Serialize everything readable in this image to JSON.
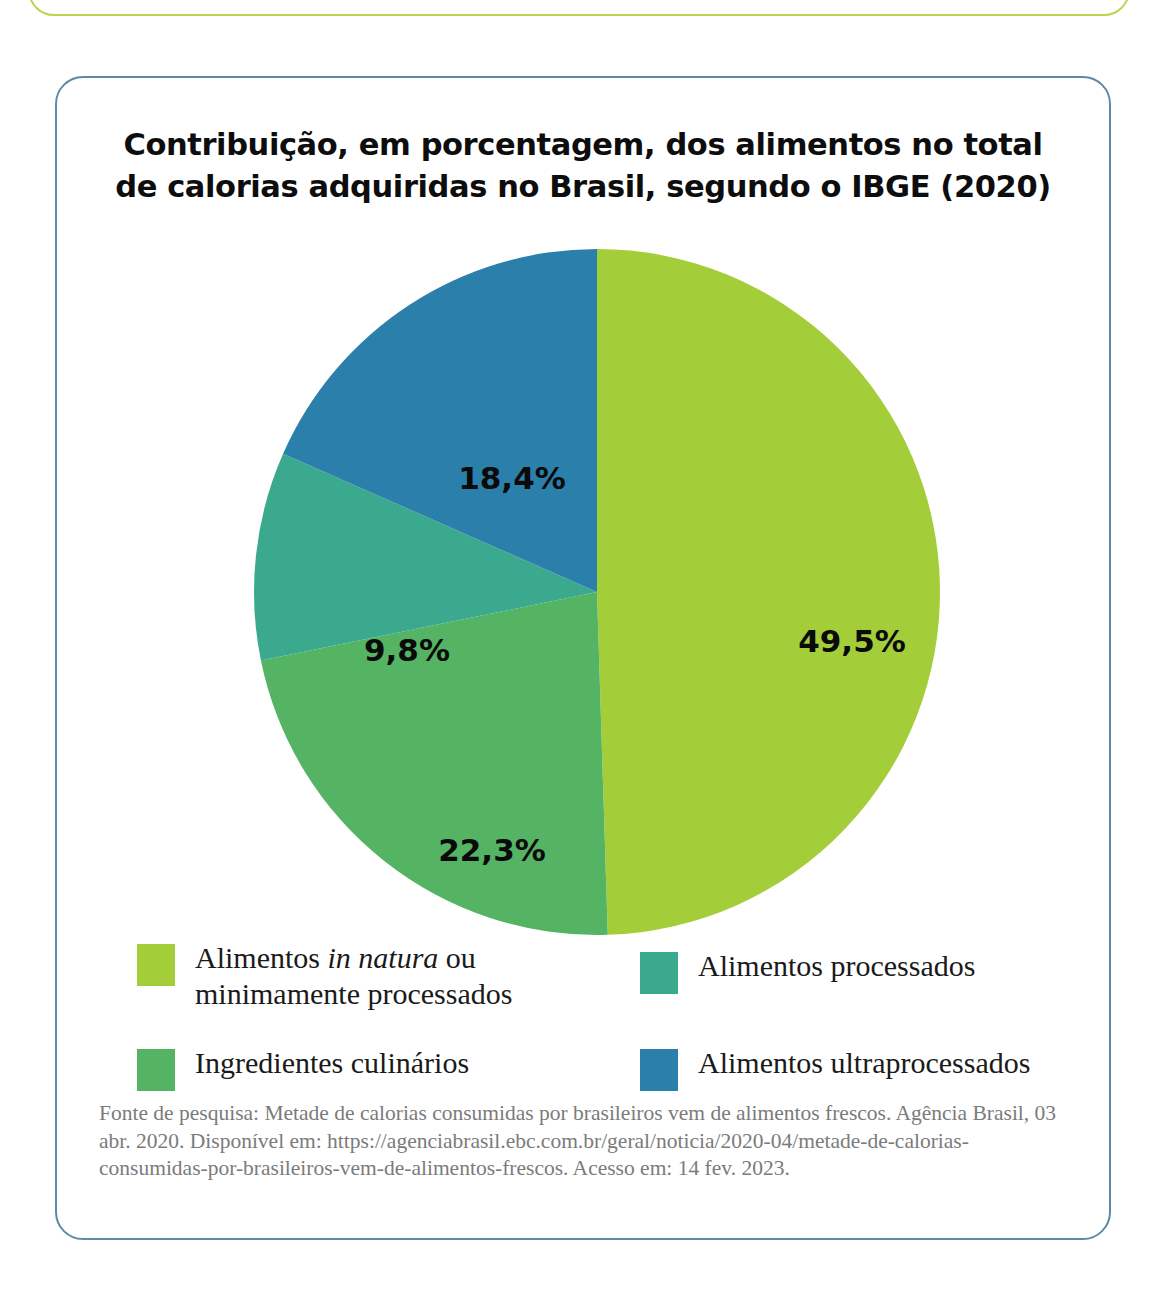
{
  "figure": {
    "title_line_1": "Contribuição, em porcentagem, dos alimentos no total",
    "title_line_2": "de calorias adquiridas no Brasil, segundo o IBGE (2020)",
    "source_note": "Fonte de pesquisa: Metade de calorias consumidas por brasileiros vem de alimentos frescos. Agência Brasil, 03 abr. 2020. Disponível em: https://agenciabrasil.ebc.com.br/geral/noticia/2020-04/metade-de-calorias-consumidas-por-brasileiros-vem-de-alimentos-frescos. Acesso em: 14 fev. 2023."
  },
  "chart_data": {
    "type": "pie",
    "title": "Contribuição, em porcentagem, dos alimentos no total de calorias adquiridas no Brasil, segundo o IBGE (2020)",
    "xlabel": "",
    "ylabel": "",
    "unit": "%",
    "legend_position": "bottom",
    "grid": false,
    "start_angle_deg": 0,
    "direction": "clockwise",
    "categories": [
      "Alimentos in natura ou minimamente processados",
      "Ingredientes culinários",
      "Alimentos processados",
      "Alimentos ultraprocessados"
    ],
    "values": [
      49.5,
      22.3,
      9.8,
      18.4
    ],
    "data_labels": [
      "49,5%",
      "22,3%",
      "9,8%",
      "18,4%"
    ],
    "colors": [
      "#a4ce39",
      "#55b364",
      "#3aa98e",
      "#2b7fab"
    ],
    "slices": [
      {
        "label": "Alimentos in natura ou minimamente processados",
        "value": 49.5,
        "display": "49,5%",
        "color": "#a4ce39",
        "label_x": 610,
        "label_y": 394
      },
      {
        "label": "Ingredientes culinários",
        "value": 22.3,
        "display": "22,3%",
        "color": "#55b364",
        "label_x": 250,
        "label_y": 603
      },
      {
        "label": "Alimentos processados",
        "value": 9.8,
        "display": "9,8%",
        "color": "#3aa98e",
        "label_x": 165,
        "label_y": 403
      },
      {
        "label": "Alimentos ultraprocessados",
        "value": 18.4,
        "display": "18,4%",
        "color": "#2b7fab",
        "label_x": 270,
        "label_y": 231
      }
    ]
  },
  "legend": {
    "items": [
      {
        "label_html": "Alimentos <i>in natura</i> ou\nminimamente processados",
        "label_text": "Alimentos in natura ou minimamente processados",
        "color": "#a4ce39"
      },
      {
        "label_html": "Ingredientes culinários",
        "label_text": "Ingredientes culinários",
        "color": "#55b364"
      },
      {
        "label_html": "Alimentos processados",
        "label_text": "Alimentos processados",
        "color": "#3aa98e"
      },
      {
        "label_html": "Alimentos ultraprocessados",
        "label_text": "Alimentos ultraprocessados",
        "color": "#2b7fab"
      }
    ]
  },
  "styling": {
    "card_border_color": "#5d8ba6",
    "top_box_border_color": "#bcd44f",
    "page_background": "#ffffff",
    "source_text_color": "#7b7b7b"
  }
}
